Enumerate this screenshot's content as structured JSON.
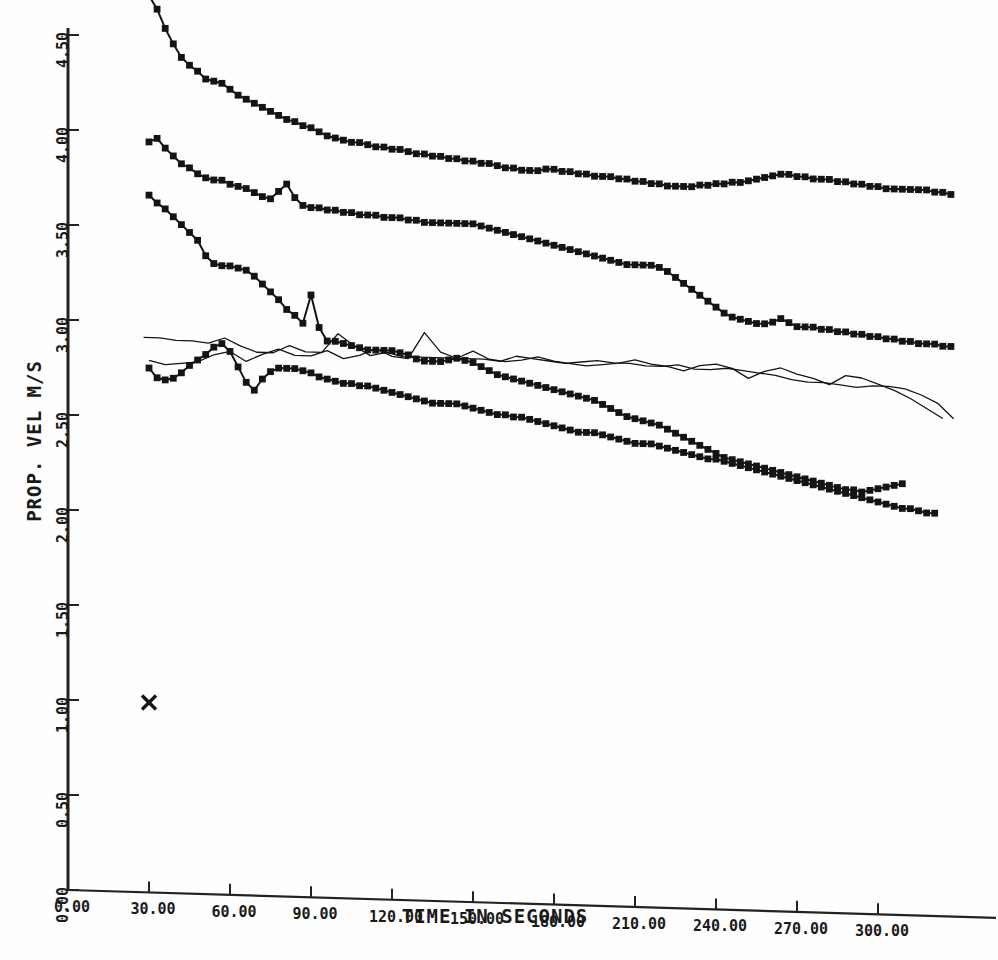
{
  "chart_data": {
    "type": "line",
    "title": "",
    "xlabel": "TIME IN SECONDS",
    "ylabel": "PROP. VEL M/S",
    "xlim": [
      0,
      330
    ],
    "ylim": [
      0,
      4.8
    ],
    "xticks": [
      "0.00",
      "30.00",
      "60.00",
      "90.00",
      "120.00",
      "150.00",
      "180.00",
      "210.00",
      "240.00",
      "270.00",
      "300.00"
    ],
    "xtick_values": [
      0,
      30,
      60,
      90,
      120,
      150,
      180,
      210,
      240,
      270,
      300
    ],
    "yticks": [
      "0.00",
      "0.50",
      "1.00",
      "1.50",
      "2.00",
      "2.50",
      "3.00",
      "3.50",
      "4.00",
      "4.50"
    ],
    "ytick_values": [
      0,
      0.5,
      1.0,
      1.5,
      2.0,
      2.5,
      3.0,
      3.5,
      4.0,
      4.5
    ],
    "grid": false,
    "legend": "none",
    "marker": "filled-square",
    "line_color": "#141414",
    "series": [
      {
        "name": "series-1",
        "marker": "filled-square",
        "x": [
          30,
          33,
          36,
          39,
          42,
          45,
          48,
          51,
          54,
          57,
          60,
          63,
          66,
          69,
          72,
          75,
          78,
          81,
          84,
          87,
          90,
          93,
          96,
          99,
          102,
          105,
          108,
          111,
          114,
          117,
          120,
          123,
          126,
          129,
          132,
          135,
          138,
          141,
          144,
          147,
          150,
          153,
          156,
          159,
          162,
          165,
          168,
          171,
          174,
          177,
          180,
          183,
          186,
          189,
          192,
          195,
          198,
          201,
          204,
          207,
          210,
          213,
          216,
          219,
          222,
          225,
          228,
          231,
          234,
          237,
          240,
          243,
          246,
          249,
          252,
          255,
          258,
          261,
          264,
          267,
          270,
          273,
          276,
          279,
          282,
          285,
          288,
          291,
          294,
          297,
          300,
          303,
          306,
          309,
          312,
          315,
          318,
          321,
          324,
          327
        ],
        "y": [
          4.72,
          4.65,
          4.55,
          4.47,
          4.4,
          4.36,
          4.33,
          4.29,
          4.28,
          4.27,
          4.24,
          4.21,
          4.19,
          4.17,
          4.15,
          4.13,
          4.11,
          4.09,
          4.08,
          4.06,
          4.05,
          4.03,
          4.01,
          4.0,
          3.99,
          3.98,
          3.98,
          3.97,
          3.96,
          3.96,
          3.95,
          3.95,
          3.94,
          3.93,
          3.93,
          3.92,
          3.92,
          3.91,
          3.91,
          3.9,
          3.9,
          3.89,
          3.89,
          3.88,
          3.87,
          3.87,
          3.86,
          3.86,
          3.86,
          3.87,
          3.87,
          3.86,
          3.86,
          3.85,
          3.85,
          3.84,
          3.84,
          3.84,
          3.83,
          3.83,
          3.82,
          3.82,
          3.81,
          3.81,
          3.8,
          3.8,
          3.8,
          3.8,
          3.81,
          3.81,
          3.82,
          3.82,
          3.83,
          3.83,
          3.84,
          3.85,
          3.86,
          3.87,
          3.88,
          3.88,
          3.87,
          3.87,
          3.86,
          3.86,
          3.86,
          3.85,
          3.85,
          3.84,
          3.84,
          3.83,
          3.83,
          3.82,
          3.82,
          3.82,
          3.82,
          3.82,
          3.82,
          3.81,
          3.81,
          3.8
        ]
      },
      {
        "name": "series-2",
        "marker": "filled-square",
        "x": [
          30,
          33,
          36,
          39,
          42,
          45,
          48,
          51,
          54,
          57,
          60,
          63,
          66,
          69,
          72,
          75,
          78,
          81,
          84,
          87,
          90,
          93,
          96,
          99,
          102,
          105,
          108,
          111,
          114,
          117,
          120,
          123,
          126,
          129,
          132,
          135,
          138,
          141,
          144,
          147,
          150,
          153,
          156,
          159,
          162,
          165,
          168,
          171,
          174,
          177,
          180,
          183,
          186,
          189,
          192,
          195,
          198,
          201,
          204,
          207,
          210,
          213,
          216,
          219,
          222,
          225,
          228,
          231,
          234,
          237,
          240,
          243,
          246,
          249,
          252,
          255,
          258,
          261,
          264,
          267,
          270,
          273,
          276,
          279,
          282,
          285,
          288,
          291,
          294,
          297,
          300,
          303,
          306,
          309,
          312,
          315,
          318,
          321,
          324,
          327
        ],
        "y": [
          3.95,
          3.97,
          3.92,
          3.88,
          3.84,
          3.82,
          3.79,
          3.77,
          3.76,
          3.76,
          3.74,
          3.73,
          3.72,
          3.7,
          3.68,
          3.67,
          3.71,
          3.75,
          3.68,
          3.64,
          3.63,
          3.63,
          3.62,
          3.62,
          3.61,
          3.61,
          3.6,
          3.6,
          3.6,
          3.59,
          3.59,
          3.59,
          3.58,
          3.58,
          3.57,
          3.57,
          3.57,
          3.57,
          3.57,
          3.57,
          3.57,
          3.56,
          3.55,
          3.54,
          3.53,
          3.52,
          3.51,
          3.5,
          3.49,
          3.48,
          3.47,
          3.46,
          3.45,
          3.44,
          3.43,
          3.42,
          3.41,
          3.4,
          3.39,
          3.38,
          3.38,
          3.38,
          3.38,
          3.37,
          3.35,
          3.32,
          3.29,
          3.26,
          3.23,
          3.2,
          3.17,
          3.14,
          3.12,
          3.11,
          3.1,
          3.09,
          3.09,
          3.1,
          3.12,
          3.1,
          3.08,
          3.08,
          3.08,
          3.07,
          3.07,
          3.06,
          3.06,
          3.05,
          3.05,
          3.04,
          3.04,
          3.03,
          3.03,
          3.02,
          3.02,
          3.01,
          3.01,
          3.01,
          3.0,
          3.0
        ]
      },
      {
        "name": "series-3",
        "marker": "filled-square",
        "x": [
          30,
          33,
          36,
          39,
          42,
          45,
          48,
          51,
          54,
          57,
          60,
          63,
          66,
          69,
          72,
          75,
          78,
          81,
          84,
          87,
          90,
          93,
          96,
          99,
          102,
          105,
          108,
          111,
          114,
          117,
          120,
          123,
          126,
          129,
          132,
          135,
          138,
          141,
          144,
          147,
          150,
          153,
          156,
          159,
          162,
          165,
          168,
          171,
          174,
          177,
          180,
          183,
          186,
          189,
          192,
          195,
          198,
          201,
          204,
          207,
          210,
          213,
          216,
          219,
          222,
          225,
          228,
          231,
          234,
          237,
          240,
          243,
          246,
          249,
          252,
          255,
          258,
          261,
          264,
          267,
          270,
          273,
          276,
          279,
          282,
          285,
          288,
          291,
          294,
          297,
          300,
          303,
          306,
          309
        ],
        "y": [
          3.67,
          3.63,
          3.6,
          3.56,
          3.52,
          3.48,
          3.44,
          3.36,
          3.32,
          3.31,
          3.31,
          3.3,
          3.29,
          3.26,
          3.22,
          3.18,
          3.14,
          3.09,
          3.06,
          3.02,
          3.17,
          3.0,
          2.93,
          2.93,
          2.92,
          2.91,
          2.9,
          2.89,
          2.89,
          2.89,
          2.89,
          2.88,
          2.87,
          2.85,
          2.84,
          2.84,
          2.84,
          2.85,
          2.86,
          2.85,
          2.84,
          2.82,
          2.8,
          2.78,
          2.77,
          2.76,
          2.75,
          2.74,
          2.73,
          2.72,
          2.71,
          2.7,
          2.69,
          2.68,
          2.67,
          2.66,
          2.64,
          2.62,
          2.6,
          2.58,
          2.57,
          2.56,
          2.55,
          2.54,
          2.52,
          2.5,
          2.48,
          2.46,
          2.44,
          2.42,
          2.4,
          2.38,
          2.37,
          2.36,
          2.35,
          2.34,
          2.33,
          2.32,
          2.31,
          2.3,
          2.29,
          2.28,
          2.27,
          2.26,
          2.25,
          2.24,
          2.23,
          2.23,
          2.22,
          2.23,
          2.24,
          2.25,
          2.26,
          2.27
        ]
      },
      {
        "name": "series-4",
        "marker": "filled-square",
        "x": [
          30,
          33,
          36,
          39,
          42,
          45,
          48,
          51,
          54,
          57,
          60,
          63,
          66,
          69,
          72,
          75,
          78,
          81,
          84,
          87,
          90,
          93,
          96,
          99,
          102,
          105,
          108,
          111,
          114,
          117,
          120,
          123,
          126,
          129,
          132,
          135,
          138,
          141,
          144,
          147,
          150,
          153,
          156,
          159,
          162,
          165,
          168,
          171,
          174,
          177,
          180,
          183,
          186,
          189,
          192,
          195,
          198,
          201,
          204,
          207,
          210,
          213,
          216,
          219,
          222,
          225,
          228,
          231,
          234,
          237,
          240,
          243,
          246,
          249,
          252,
          255,
          258,
          261,
          264,
          267,
          270,
          273,
          276,
          279,
          282,
          285,
          288,
          291,
          294,
          297,
          300,
          303,
          306,
          309,
          312,
          315,
          318,
          321
        ],
        "y": [
          2.76,
          2.71,
          2.7,
          2.71,
          2.74,
          2.78,
          2.81,
          2.84,
          2.88,
          2.9,
          2.86,
          2.78,
          2.7,
          2.66,
          2.72,
          2.76,
          2.78,
          2.78,
          2.78,
          2.77,
          2.76,
          2.74,
          2.73,
          2.72,
          2.71,
          2.71,
          2.7,
          2.7,
          2.69,
          2.68,
          2.67,
          2.66,
          2.65,
          2.64,
          2.63,
          2.62,
          2.62,
          2.62,
          2.62,
          2.61,
          2.6,
          2.59,
          2.58,
          2.57,
          2.57,
          2.56,
          2.56,
          2.55,
          2.54,
          2.53,
          2.52,
          2.51,
          2.5,
          2.49,
          2.49,
          2.49,
          2.48,
          2.47,
          2.46,
          2.45,
          2.44,
          2.44,
          2.44,
          2.43,
          2.42,
          2.41,
          2.4,
          2.39,
          2.38,
          2.37,
          2.37,
          2.36,
          2.35,
          2.34,
          2.33,
          2.32,
          2.31,
          2.3,
          2.29,
          2.28,
          2.27,
          2.26,
          2.25,
          2.24,
          2.23,
          2.22,
          2.21,
          2.2,
          2.19,
          2.18,
          2.17,
          2.16,
          2.15,
          2.14,
          2.14,
          2.13,
          2.12,
          2.12
        ]
      },
      {
        "name": "series-5-thin",
        "marker": "none",
        "x": [
          28,
          34,
          40,
          46,
          52,
          58,
          64,
          70,
          76,
          82,
          88,
          94,
          100,
          106,
          112,
          118,
          124,
          130,
          136,
          142,
          148,
          154,
          160,
          166,
          172,
          178,
          184,
          190,
          196,
          202,
          208,
          214,
          220,
          226,
          232,
          238,
          244,
          250,
          256,
          262,
          268,
          274,
          280,
          286,
          292,
          298,
          304,
          310,
          316,
          322,
          328
        ],
        "y": [
          2.92,
          2.92,
          2.91,
          2.91,
          2.9,
          2.93,
          2.89,
          2.86,
          2.86,
          2.9,
          2.87,
          2.87,
          2.97,
          2.91,
          2.86,
          2.88,
          2.86,
          2.86,
          2.86,
          2.86,
          2.86,
          2.86,
          2.85,
          2.88,
          2.87,
          2.86,
          2.85,
          2.86,
          2.87,
          2.86,
          2.86,
          2.85,
          2.85,
          2.86,
          2.84,
          2.84,
          2.85,
          2.84,
          2.83,
          2.82,
          2.8,
          2.79,
          2.79,
          2.78,
          2.77,
          2.78,
          2.78,
          2.77,
          2.74,
          2.7,
          2.62
        ]
      },
      {
        "name": "series-6-thin",
        "marker": "none",
        "x": [
          30,
          36,
          42,
          48,
          54,
          60,
          66,
          72,
          78,
          84,
          90,
          96,
          102,
          108,
          114,
          120,
          126,
          132,
          138,
          144,
          150,
          156,
          162,
          168,
          174,
          180,
          186,
          192,
          198,
          204,
          210,
          216,
          222,
          228,
          234,
          240,
          246,
          252,
          258,
          264,
          270,
          276,
          282,
          288,
          294,
          300,
          306,
          312,
          318,
          324
        ],
        "y": [
          2.8,
          2.78,
          2.79,
          2.8,
          2.84,
          2.86,
          2.81,
          2.85,
          2.88,
          2.85,
          2.85,
          2.88,
          2.84,
          2.86,
          2.9,
          2.86,
          2.85,
          2.99,
          2.89,
          2.86,
          2.9,
          2.86,
          2.85,
          2.86,
          2.88,
          2.86,
          2.85,
          2.84,
          2.85,
          2.86,
          2.88,
          2.86,
          2.85,
          2.83,
          2.86,
          2.87,
          2.85,
          2.8,
          2.84,
          2.86,
          2.83,
          2.81,
          2.78,
          2.83,
          2.82,
          2.79,
          2.76,
          2.72,
          2.67,
          2.62
        ]
      }
    ],
    "annotations": [
      {
        "name": "x-marker",
        "symbol": "X",
        "x": 30,
        "y": 1.0
      }
    ]
  }
}
